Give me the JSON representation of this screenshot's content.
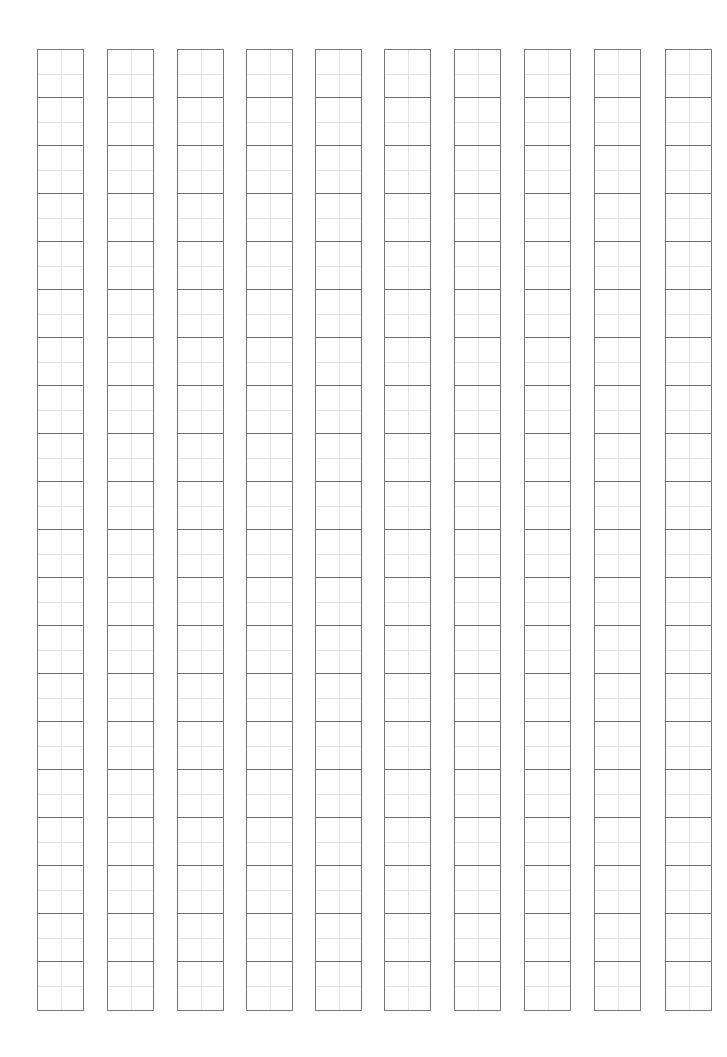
{
  "sheet": {
    "type": "tianzige-practice-grid",
    "columns": 10,
    "cells_per_column": 20,
    "column_lefts": [
      37,
      107,
      177,
      246,
      315,
      384,
      454,
      524,
      594,
      665
    ],
    "colors": {
      "border": "#7a7a7a",
      "guide": "#e2e2e2",
      "background": "#ffffff"
    }
  }
}
